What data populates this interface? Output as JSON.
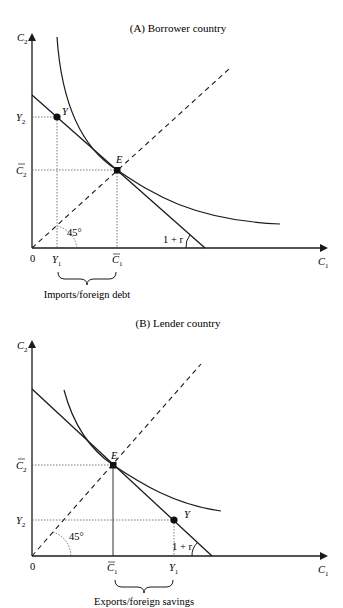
{
  "panels": [
    {
      "id": "A",
      "title": "(A) Borrower country",
      "y_axis_label": "C",
      "y_axis_sub": "2",
      "x_axis_label": "C",
      "x_axis_sub": "1",
      "origin_label": "0",
      "point_y_label": "Y",
      "point_e_label": "E",
      "y2_label": "Y",
      "y2_sub": "2",
      "cbar2_label": "C",
      "cbar2_sub": "2",
      "y1_label": "Y",
      "y1_sub": "1",
      "cbar1_label": "C",
      "cbar1_sub": "1",
      "angle45_label": "45°",
      "slope_label": "1 + r",
      "brace_caption": "Imports/foreign debt"
    },
    {
      "id": "B",
      "title": "(B) Lender country",
      "y_axis_label": "C",
      "y_axis_sub": "2",
      "x_axis_label": "C",
      "x_axis_sub": "1",
      "origin_label": "0",
      "point_y_label": "Y",
      "point_e_label": "E",
      "y2_label": "Y",
      "y2_sub": "2",
      "cbar2_label": "C",
      "cbar2_sub": "2",
      "y1_label": "Y",
      "y1_sub": "1",
      "cbar1_label": "C",
      "cbar1_sub": "1",
      "angle45_label": "45°",
      "slope_label": "1 + r",
      "brace_caption": "Exports/foreign savings"
    }
  ],
  "colors": {
    "line": "#1a1a1a",
    "dotted": "#555555",
    "background": "#ffffff"
  }
}
